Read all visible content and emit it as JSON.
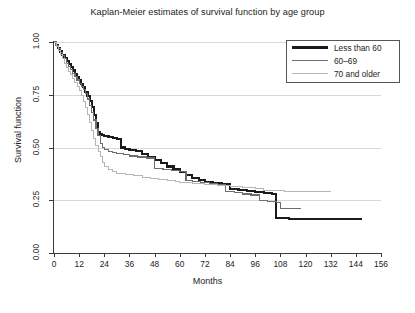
{
  "chart_data": {
    "type": "line",
    "title": "Kaplan-Meier estimates of survival function by age group",
    "xlabel": "Months",
    "ylabel": "Survival function",
    "xlim": [
      0,
      156
    ],
    "ylim": [
      0,
      1
    ],
    "xticks": [
      0,
      12,
      24,
      36,
      48,
      60,
      72,
      84,
      96,
      108,
      120,
      132,
      144,
      156
    ],
    "yticks": [
      0.0,
      0.25,
      0.5,
      0.75,
      1.0
    ],
    "ytick_labels": [
      "0.00",
      "0.25",
      "0.50",
      "0.75",
      "1.00"
    ],
    "grid": true,
    "grid_axis": "y",
    "legend_position": "upper right",
    "step": "post",
    "series": [
      {
        "name": "Less than 60",
        "color": "#1b1b1b",
        "width": 2.1,
        "points": [
          [
            0,
            1.0
          ],
          [
            1,
            0.985
          ],
          [
            2,
            0.97
          ],
          [
            3,
            0.955
          ],
          [
            4,
            0.94
          ],
          [
            5,
            0.925
          ],
          [
            6,
            0.91
          ],
          [
            7,
            0.895
          ],
          [
            8,
            0.88
          ],
          [
            9,
            0.865
          ],
          [
            10,
            0.85
          ],
          [
            11,
            0.835
          ],
          [
            12,
            0.82
          ],
          [
            13,
            0.8
          ],
          [
            14,
            0.785
          ],
          [
            15,
            0.765
          ],
          [
            16,
            0.745
          ],
          [
            17,
            0.72
          ],
          [
            18,
            0.69
          ],
          [
            19,
            0.655
          ],
          [
            20,
            0.615
          ],
          [
            21,
            0.575
          ],
          [
            22,
            0.565
          ],
          [
            23,
            0.56
          ],
          [
            24,
            0.555
          ],
          [
            26,
            0.55
          ],
          [
            28,
            0.545
          ],
          [
            30,
            0.54
          ],
          [
            32,
            0.5
          ],
          [
            34,
            0.495
          ],
          [
            36,
            0.49
          ],
          [
            39,
            0.485
          ],
          [
            42,
            0.47
          ],
          [
            45,
            0.455
          ],
          [
            48,
            0.44
          ],
          [
            51,
            0.425
          ],
          [
            54,
            0.41
          ],
          [
            57,
            0.4
          ],
          [
            60,
            0.385
          ],
          [
            63,
            0.37
          ],
          [
            66,
            0.355
          ],
          [
            69,
            0.345
          ],
          [
            72,
            0.335
          ],
          [
            76,
            0.33
          ],
          [
            80,
            0.325
          ],
          [
            84,
            0.305
          ],
          [
            88,
            0.3
          ],
          [
            92,
            0.295
          ],
          [
            96,
            0.29
          ],
          [
            100,
            0.285
          ],
          [
            104,
            0.28
          ],
          [
            106,
            0.165
          ],
          [
            112,
            0.16
          ],
          [
            120,
            0.16
          ],
          [
            132,
            0.16
          ],
          [
            144,
            0.16
          ],
          [
            147,
            0.16
          ]
        ]
      },
      {
        "name": "60–69",
        "color": "#6e6e6e",
        "width": 1.2,
        "points": [
          [
            0,
            1.0
          ],
          [
            1,
            0.985
          ],
          [
            2,
            0.97
          ],
          [
            3,
            0.95
          ],
          [
            4,
            0.935
          ],
          [
            5,
            0.92
          ],
          [
            6,
            0.9
          ],
          [
            7,
            0.885
          ],
          [
            8,
            0.87
          ],
          [
            9,
            0.85
          ],
          [
            10,
            0.835
          ],
          [
            11,
            0.82
          ],
          [
            12,
            0.805
          ],
          [
            13,
            0.79
          ],
          [
            14,
            0.775
          ],
          [
            15,
            0.755
          ],
          [
            16,
            0.73
          ],
          [
            17,
            0.7
          ],
          [
            18,
            0.665
          ],
          [
            19,
            0.63
          ],
          [
            20,
            0.59
          ],
          [
            21,
            0.555
          ],
          [
            22,
            0.52
          ],
          [
            23,
            0.5
          ],
          [
            24,
            0.49
          ],
          [
            26,
            0.48
          ],
          [
            28,
            0.475
          ],
          [
            30,
            0.47
          ],
          [
            33,
            0.465
          ],
          [
            36,
            0.46
          ],
          [
            40,
            0.455
          ],
          [
            44,
            0.45
          ],
          [
            48,
            0.4
          ],
          [
            52,
            0.395
          ],
          [
            56,
            0.39
          ],
          [
            60,
            0.385
          ],
          [
            63,
            0.345
          ],
          [
            66,
            0.34
          ],
          [
            70,
            0.335
          ],
          [
            74,
            0.33
          ],
          [
            78,
            0.325
          ],
          [
            82,
            0.29
          ],
          [
            86,
            0.285
          ],
          [
            90,
            0.28
          ],
          [
            94,
            0.275
          ],
          [
            98,
            0.25
          ],
          [
            102,
            0.245
          ],
          [
            106,
            0.24
          ],
          [
            108,
            0.21
          ],
          [
            112,
            0.21
          ],
          [
            118,
            0.21
          ]
        ]
      },
      {
        "name": "70 and older",
        "color": "#b6b6b6",
        "width": 1.0,
        "points": [
          [
            0,
            1.0
          ],
          [
            1,
            0.98
          ],
          [
            2,
            0.96
          ],
          [
            3,
            0.94
          ],
          [
            4,
            0.92
          ],
          [
            5,
            0.9
          ],
          [
            6,
            0.88
          ],
          [
            7,
            0.86
          ],
          [
            8,
            0.845
          ],
          [
            9,
            0.825
          ],
          [
            10,
            0.81
          ],
          [
            11,
            0.79
          ],
          [
            12,
            0.77
          ],
          [
            13,
            0.745
          ],
          [
            14,
            0.72
          ],
          [
            15,
            0.69
          ],
          [
            16,
            0.655
          ],
          [
            17,
            0.62
          ],
          [
            18,
            0.58
          ],
          [
            19,
            0.545
          ],
          [
            20,
            0.51
          ],
          [
            21,
            0.48
          ],
          [
            22,
            0.455
          ],
          [
            23,
            0.43
          ],
          [
            24,
            0.41
          ],
          [
            26,
            0.395
          ],
          [
            28,
            0.385
          ],
          [
            30,
            0.375
          ],
          [
            34,
            0.37
          ],
          [
            38,
            0.365
          ],
          [
            42,
            0.36
          ],
          [
            46,
            0.355
          ],
          [
            50,
            0.35
          ],
          [
            54,
            0.345
          ],
          [
            58,
            0.34
          ],
          [
            60,
            0.335
          ],
          [
            66,
            0.33
          ],
          [
            72,
            0.325
          ],
          [
            78,
            0.32
          ],
          [
            84,
            0.315
          ],
          [
            90,
            0.31
          ],
          [
            96,
            0.305
          ],
          [
            100,
            0.295
          ],
          [
            110,
            0.29
          ],
          [
            120,
            0.29
          ],
          [
            132,
            0.29
          ]
        ]
      }
    ]
  },
  "legend": {
    "entries": [
      {
        "label": "Less than 60"
      },
      {
        "label": "60–69"
      },
      {
        "label": "70 and older"
      }
    ]
  }
}
